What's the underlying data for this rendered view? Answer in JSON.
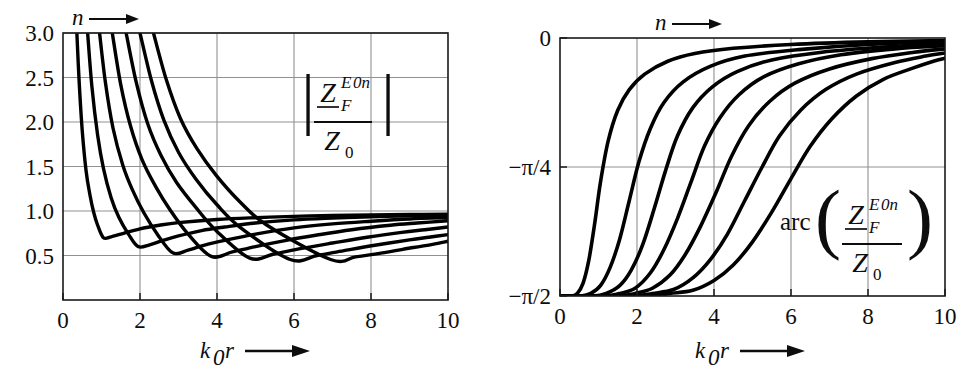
{
  "figure": {
    "name": "field-impedance-E0n-modes",
    "background": "#ffffff",
    "curve_color": "#000000",
    "grid_color": "#919191",
    "frame_color": "#1a1a1a"
  },
  "panels": [
    {
      "id": "magnitude",
      "top_axis_label": "n",
      "top_axis_arrow": "→",
      "x_axis_label_k": "k",
      "x_axis_label_k_sub": "0",
      "x_axis_label_r": "r",
      "x_axis_arrow": "→",
      "formula": {
        "bar_left": "|",
        "bar_right": "|",
        "numerator_main": "Z",
        "numerator_sub": "F",
        "numerator_sup": "E",
        "numerator_sup2": "0n",
        "denominator_main": "Z",
        "denominator_sub": "0"
      }
    },
    {
      "id": "phase",
      "top_axis_label": "n",
      "top_axis_arrow": "→",
      "x_axis_label_k": "k",
      "x_axis_label_k_sub": "0",
      "x_axis_label_r": "r",
      "x_axis_arrow": "→",
      "formula": {
        "prefix": "arc",
        "paren_left": "(",
        "paren_right": ")",
        "numerator_main": "Z",
        "numerator_sub": "F",
        "numerator_sup": "E",
        "numerator_sup2": "0n",
        "denominator_main": "Z",
        "denominator_sub": "0"
      }
    }
  ],
  "chart_data": [
    {
      "type": "line",
      "title": "Magnitude of normalized field impedance for E0n modes",
      "xlabel": "k0 r",
      "ylabel": "|Z_F^{E0n} / Z_0|",
      "xlim": [
        0,
        10
      ],
      "ylim": [
        0,
        3.0
      ],
      "grid": true,
      "xticks": [
        0,
        2,
        4,
        6,
        8,
        10
      ],
      "xtick_labels": [
        "0",
        "2",
        "4",
        "6",
        "8",
        "10"
      ],
      "yticks": [
        0.5,
        1.0,
        1.5,
        2.0,
        2.5,
        3.0
      ],
      "ytick_labels": [
        "0.5",
        "1.0",
        "1.5",
        "2.0",
        "2.5",
        "3.0"
      ],
      "legend": null,
      "annotations": [
        "n → marks increasing mode order to the right"
      ],
      "series": [
        {
          "name": "n=1",
          "cutoff": 0.35,
          "minimum": {
            "x": 1.05,
            "y": 0.7
          },
          "x": [
            0.36,
            0.42,
            0.5,
            0.6,
            0.7,
            0.8,
            0.9,
            1.05,
            1.25,
            1.5,
            2.0,
            2.5,
            3.0,
            4.0,
            5.0,
            6.0,
            7.0,
            8.0,
            9.0,
            10.0
          ],
          "y": [
            3.0,
            2.45,
            1.9,
            1.45,
            1.18,
            0.98,
            0.84,
            0.7,
            0.71,
            0.74,
            0.8,
            0.84,
            0.87,
            0.905,
            0.925,
            0.94,
            0.95,
            0.955,
            0.96,
            0.965
          ]
        },
        {
          "name": "n=2",
          "cutoff": 0.62,
          "minimum": {
            "x": 1.95,
            "y": 0.6
          },
          "x": [
            0.64,
            0.75,
            0.9,
            1.05,
            1.25,
            1.45,
            1.7,
            1.95,
            2.25,
            2.6,
            3.0,
            3.6,
            4.2,
            5.0,
            6.0,
            7.0,
            8.0,
            9.0,
            10.0
          ],
          "y": [
            3.0,
            2.4,
            1.85,
            1.48,
            1.15,
            0.93,
            0.74,
            0.6,
            0.62,
            0.67,
            0.72,
            0.78,
            0.82,
            0.865,
            0.9,
            0.92,
            0.935,
            0.945,
            0.95
          ]
        },
        {
          "name": "n=3",
          "cutoff": 0.92,
          "minimum": {
            "x": 2.85,
            "y": 0.53
          },
          "x": [
            0.95,
            1.1,
            1.3,
            1.55,
            1.8,
            2.1,
            2.45,
            2.85,
            3.25,
            3.7,
            4.2,
            5.0,
            6.0,
            7.0,
            8.0,
            9.0,
            10.0
          ],
          "y": [
            3.0,
            2.45,
            1.93,
            1.52,
            1.24,
            0.98,
            0.74,
            0.53,
            0.56,
            0.62,
            0.67,
            0.74,
            0.81,
            0.855,
            0.885,
            0.91,
            0.925
          ]
        },
        {
          "name": "n=4",
          "cutoff": 1.25,
          "minimum": {
            "x": 3.85,
            "y": 0.49
          },
          "x": [
            1.28,
            1.5,
            1.75,
            2.05,
            2.4,
            2.8,
            3.25,
            3.85,
            4.4,
            5.0,
            5.8,
            6.6,
            7.5,
            8.5,
            9.2,
            10.0
          ],
          "y": [
            3.0,
            2.42,
            1.96,
            1.58,
            1.28,
            1.0,
            0.74,
            0.49,
            0.54,
            0.6,
            0.67,
            0.73,
            0.79,
            0.84,
            0.865,
            0.89
          ]
        },
        {
          "name": "n=5",
          "cutoff": 1.6,
          "minimum": {
            "x": 4.85,
            "y": 0.47
          },
          "x": [
            1.64,
            1.9,
            2.2,
            2.55,
            2.95,
            3.45,
            4.0,
            4.85,
            5.5,
            6.2,
            7.0,
            7.9,
            8.8,
            9.4,
            10.0
          ],
          "y": [
            3.0,
            2.45,
            1.98,
            1.62,
            1.32,
            1.04,
            0.77,
            0.47,
            0.52,
            0.58,
            0.64,
            0.705,
            0.76,
            0.79,
            0.82
          ]
        },
        {
          "name": "n=6",
          "cutoff": 1.95,
          "minimum": {
            "x": 5.9,
            "y": 0.455
          },
          "x": [
            2.0,
            2.3,
            2.62,
            3.0,
            3.45,
            4.0,
            4.65,
            5.9,
            6.6,
            7.3,
            8.1,
            9.0,
            9.5,
            10.0
          ],
          "y": [
            3.0,
            2.46,
            2.02,
            1.66,
            1.36,
            1.07,
            0.8,
            0.455,
            0.5,
            0.555,
            0.615,
            0.675,
            0.705,
            0.735
          ]
        },
        {
          "name": "n=7",
          "cutoff": 2.3,
          "minimum": {
            "x": 6.95,
            "y": 0.455
          },
          "x": [
            2.35,
            2.68,
            3.05,
            3.48,
            3.98,
            4.58,
            5.3,
            6.95,
            7.6,
            8.3,
            9.1,
            9.6,
            10.0
          ],
          "y": [
            3.0,
            2.48,
            2.04,
            1.7,
            1.4,
            1.11,
            0.84,
            0.455,
            0.485,
            0.53,
            0.59,
            0.625,
            0.66
          ]
        }
      ]
    },
    {
      "type": "line",
      "title": "Phase of normalized field impedance for E0n modes",
      "xlabel": "k0 r",
      "ylabel": "arc(Z_F^{E0n} / Z_0)",
      "xlim": [
        0,
        10
      ],
      "ylim": [
        -1.5707963,
        0
      ],
      "grid": true,
      "xticks": [
        0,
        2,
        4,
        6,
        8,
        10
      ],
      "xtick_labels": [
        "0",
        "2",
        "4",
        "6",
        "8",
        "10"
      ],
      "yticks": [
        0,
        -0.7853982,
        -1.5707963
      ],
      "ytick_labels": [
        "0",
        "−π/4",
        "−π/2"
      ],
      "legend": null,
      "annotations": [
        "n → marks increasing mode order to the right"
      ],
      "series": [
        {
          "name": "n=1",
          "x": [
            0.3,
            0.45,
            0.6,
            0.75,
            0.9,
            1.05,
            1.25,
            1.5,
            1.8,
            2.2,
            2.8,
            3.5,
            4.5,
            6.0,
            8.0,
            10.0
          ],
          "y_frac": [
            -1.0,
            -0.99,
            -0.95,
            -0.86,
            -0.72,
            -0.56,
            -0.4,
            -0.28,
            -0.2,
            -0.14,
            -0.09,
            -0.06,
            -0.04,
            -0.025,
            -0.015,
            -0.01
          ]
        },
        {
          "name": "n=2",
          "x": [
            0.55,
            0.8,
            1.05,
            1.3,
            1.55,
            1.8,
            2.05,
            2.35,
            2.7,
            3.2,
            3.9,
            4.8,
            6.2,
            8.0,
            10.0
          ],
          "y_frac": [
            -1.0,
            -0.99,
            -0.96,
            -0.89,
            -0.78,
            -0.63,
            -0.48,
            -0.35,
            -0.25,
            -0.17,
            -0.11,
            -0.07,
            -0.045,
            -0.025,
            -0.015
          ]
        },
        {
          "name": "n=3",
          "x": [
            0.85,
            1.2,
            1.55,
            1.85,
            2.15,
            2.45,
            2.75,
            3.05,
            3.45,
            3.95,
            4.6,
            5.5,
            6.8,
            8.4,
            10.0
          ],
          "y_frac": [
            -1.0,
            -0.99,
            -0.96,
            -0.9,
            -0.8,
            -0.66,
            -0.51,
            -0.38,
            -0.27,
            -0.19,
            -0.13,
            -0.085,
            -0.055,
            -0.035,
            -0.022
          ]
        },
        {
          "name": "n=4",
          "x": [
            1.15,
            1.55,
            1.95,
            2.35,
            2.7,
            3.05,
            3.4,
            3.75,
            4.15,
            4.65,
            5.3,
            6.2,
            7.3,
            8.7,
            10.0
          ],
          "y_frac": [
            -1.0,
            -0.99,
            -0.97,
            -0.91,
            -0.82,
            -0.7,
            -0.56,
            -0.42,
            -0.31,
            -0.22,
            -0.15,
            -0.1,
            -0.065,
            -0.042,
            -0.03
          ]
        },
        {
          "name": "n=5",
          "x": [
            1.5,
            1.95,
            2.4,
            2.85,
            3.25,
            3.65,
            4.05,
            4.45,
            4.9,
            5.45,
            6.1,
            7.0,
            8.1,
            9.2,
            10.0
          ],
          "y_frac": [
            -1.0,
            -0.99,
            -0.97,
            -0.92,
            -0.84,
            -0.73,
            -0.6,
            -0.46,
            -0.34,
            -0.245,
            -0.175,
            -0.12,
            -0.08,
            -0.055,
            -0.042
          ]
        },
        {
          "name": "n=6",
          "x": [
            1.85,
            2.4,
            2.95,
            3.45,
            3.9,
            4.35,
            4.8,
            5.25,
            5.7,
            6.25,
            6.9,
            7.7,
            8.7,
            9.5,
            10.0
          ],
          "y_frac": [
            -1.0,
            -0.99,
            -0.975,
            -0.93,
            -0.86,
            -0.76,
            -0.63,
            -0.5,
            -0.38,
            -0.28,
            -0.2,
            -0.14,
            -0.095,
            -0.07,
            -0.058
          ]
        },
        {
          "name": "n=7",
          "x": [
            2.25,
            2.85,
            3.45,
            4.0,
            4.5,
            5.0,
            5.5,
            6.0,
            6.5,
            7.05,
            7.7,
            8.4,
            9.2,
            9.7,
            10.0
          ],
          "y_frac": [
            -1.0,
            -0.99,
            -0.978,
            -0.94,
            -0.88,
            -0.79,
            -0.675,
            -0.545,
            -0.42,
            -0.315,
            -0.225,
            -0.16,
            -0.115,
            -0.09,
            -0.078
          ]
        }
      ]
    }
  ]
}
